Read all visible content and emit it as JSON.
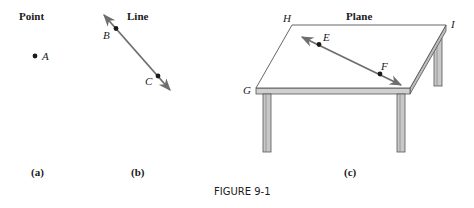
{
  "figure": {
    "caption": "FIGURE 9-1",
    "panels": [
      {
        "id": "a",
        "title": "Point",
        "sublabel": "(a)",
        "points": [
          "A"
        ]
      },
      {
        "id": "b",
        "title": "Line",
        "sublabel": "(b)",
        "points": [
          "B",
          "C"
        ]
      },
      {
        "id": "c",
        "title": "Plane",
        "sublabel": "(c)",
        "corners": [
          "H",
          "I",
          "G"
        ],
        "points": [
          "E",
          "F"
        ]
      }
    ]
  },
  "colors": {
    "ink": "#1a1a1a",
    "line_gray": "#6e6e6e",
    "table_edge": "#555555",
    "leg_fill": "#bdbdbd"
  }
}
